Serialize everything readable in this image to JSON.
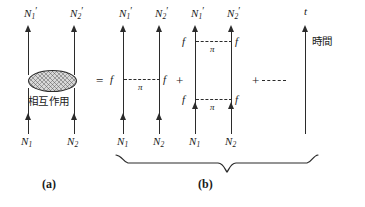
{
  "figure": {
    "type": "feynman-diagram",
    "panels": [
      {
        "id": "a",
        "label": "(a)"
      },
      {
        "id": "b",
        "label": "(b)"
      }
    ],
    "operators": {
      "equals": "=",
      "plus_1": "+",
      "plus_2": "+",
      "dots": "- - -"
    },
    "axis": {
      "symbol": "t",
      "name": "時間"
    },
    "blob": {
      "label": "相互作用"
    },
    "diagram_a": {
      "outgoing": [
        {
          "base": "N",
          "sub": "1",
          "prime": "′"
        },
        {
          "base": "N",
          "sub": "2",
          "prime": "′"
        }
      ],
      "incoming": [
        {
          "base": "N",
          "sub": "1",
          "prime": ""
        },
        {
          "base": "N",
          "sub": "2",
          "prime": ""
        }
      ]
    },
    "diagram_b1": {
      "outgoing": [
        {
          "base": "N",
          "sub": "1",
          "prime": "′"
        },
        {
          "base": "N",
          "sub": "2",
          "prime": "′"
        }
      ],
      "incoming": [
        {
          "base": "N",
          "sub": "1",
          "prime": ""
        },
        {
          "base": "N",
          "sub": "2",
          "prime": ""
        }
      ],
      "exchanges": [
        {
          "mediator": "π",
          "vertex_left": "f",
          "vertex_right": "f"
        }
      ]
    },
    "diagram_b2": {
      "outgoing": [
        {
          "base": "N",
          "sub": "1",
          "prime": "′"
        },
        {
          "base": "N",
          "sub": "2",
          "prime": "′"
        }
      ],
      "incoming": [
        {
          "base": "N",
          "sub": "1",
          "prime": ""
        },
        {
          "base": "N",
          "sub": "2",
          "prime": ""
        }
      ],
      "exchanges": [
        {
          "mediator": "π",
          "vertex_left": "f",
          "vertex_right": "f"
        },
        {
          "mediator": "π",
          "vertex_left": "f",
          "vertex_right": "f"
        }
      ]
    }
  }
}
